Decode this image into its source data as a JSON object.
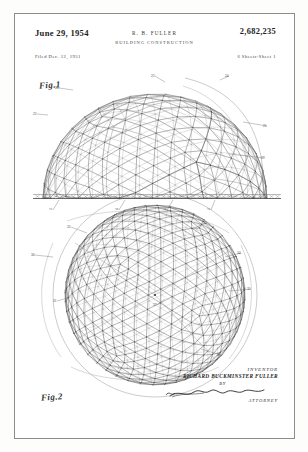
{
  "page": {
    "date": "June 29, 1954",
    "inventor_initials": "R. B. FULLER",
    "title": "BUILDING CONSTRUCTION",
    "patent_number": "2,682,235",
    "filed": "Filed Dec. 12, 1951",
    "sheets": "6 Sheets-Sheet 1"
  },
  "figures": {
    "fig1_label": "Fig.1",
    "fig2_label": "Fig.2"
  },
  "signature": {
    "inventor_label": "INVENTOR",
    "inventor_name": "RICHARD BUCKMINSTER FULLER",
    "by_label": "BY",
    "attorney_label": "ATTORNEY"
  },
  "reference_numerals": {
    "fig1": [
      "20",
      "21",
      "22",
      "23",
      "24",
      "25",
      "26",
      "27",
      "28"
    ],
    "fig2": [
      "30",
      "31",
      "32",
      "33",
      "34",
      "35",
      "36",
      "37"
    ]
  },
  "colors": {
    "page": "#fdfdfc",
    "frame": "#8d8d8d",
    "ink": "#3a3a3a",
    "line": "#555555"
  }
}
